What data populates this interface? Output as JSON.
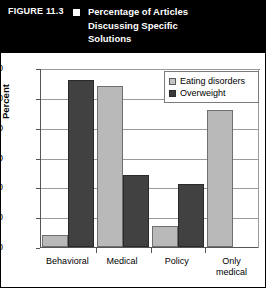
{
  "figure": {
    "number_label": "FIGURE 11.3",
    "bullet_icon": "white-square-icon",
    "title_lines": [
      "Percentage of Articles",
      "Discussing Specific",
      "Solutions"
    ]
  },
  "legend": {
    "position": "top-right",
    "entries": [
      {
        "label": "Eating disorders",
        "swatch": "light-gray-square-icon",
        "color": "#c4c4c4"
      },
      {
        "label": "Overweight",
        "swatch": "dark-gray-square-icon",
        "color": "#3a3a3a"
      }
    ]
  },
  "chart_data": {
    "type": "bar",
    "title": "Percentage of Articles Discussing Specific Solutions",
    "xlabel": "",
    "ylabel": "Percent",
    "ylim": [
      0,
      60
    ],
    "yticks": [
      0,
      10,
      20,
      30,
      40,
      50,
      60
    ],
    "grid": true,
    "legend_position": "top-right",
    "categories": [
      "Behavioral",
      "Medical",
      "Policy",
      "Only medical"
    ],
    "category_label_lines": [
      [
        "Behavioral"
      ],
      [
        "Medical"
      ],
      [
        "Policy"
      ],
      [
        "Only",
        "medical"
      ]
    ],
    "series": [
      {
        "name": "Eating disorders",
        "color": "#b9b9b9",
        "values": [
          4,
          54,
          7,
          46
        ]
      },
      {
        "name": "Overweight",
        "color": "#414141",
        "values": [
          56,
          24,
          21,
          null
        ]
      }
    ]
  }
}
